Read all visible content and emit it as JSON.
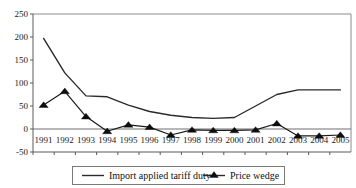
{
  "chart_data": {
    "type": "line",
    "title": "",
    "xlabel": "",
    "ylabel": "",
    "categories": [
      "1991",
      "1992",
      "1993",
      "1994",
      "1995",
      "1996",
      "1997",
      "1998",
      "1999",
      "2000",
      "2001",
      "2002",
      "2003",
      "2004",
      "2005"
    ],
    "series": [
      {
        "name": "Import applied tariff duty",
        "marker": "none",
        "values": [
          197,
          122,
          72,
          70,
          52,
          38,
          30,
          25,
          23,
          25,
          50,
          75,
          85,
          85,
          85
        ]
      },
      {
        "name": "Price wedge",
        "marker": "triangle",
        "values": [
          52,
          82,
          27,
          -5,
          9,
          4,
          -13,
          -2,
          -3,
          -3,
          -2,
          12,
          -15,
          -15,
          -13
        ]
      }
    ],
    "ylim": [
      -50,
      250
    ],
    "yticks": [
      -50,
      0,
      50,
      100,
      150,
      200,
      250
    ],
    "ytick_labels": [
      "-50",
      "0",
      "50",
      "100",
      "150",
      "200",
      "250"
    ],
    "xtick_labels": [
      "1991",
      "1992",
      "1993",
      "1994",
      "1995",
      "1996",
      "1997",
      "1998",
      "1999",
      "2000",
      "2001",
      "2002",
      "2003",
      "2004",
      "2005"
    ],
    "grid": false,
    "zero_line": true,
    "legend_position": "bottom",
    "legend_entries": [
      {
        "label": "Import applied tariff duty",
        "marker": "none"
      },
      {
        "label": "Price wedge",
        "marker": "triangle"
      }
    ],
    "colors": {
      "tariff_line": "#2a2a2a",
      "wedge_line": "#1a1a1a",
      "wedge_marker": "#0d0d0d",
      "axis": "#5a5a5a",
      "frame": "#8c8c8c",
      "background": "#ffffff",
      "text": "#111111"
    }
  }
}
